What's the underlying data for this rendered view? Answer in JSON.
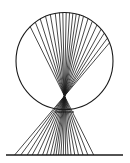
{
  "figure": {
    "stroke_color": "#1a1a1a",
    "background": "#ffffff",
    "circle": {
      "cx": 64.5,
      "cy": 61,
      "r": 48.5
    },
    "focal_point": {
      "x": 64.5,
      "y": 96
    },
    "baseline": {
      "y": 155,
      "x1": 6,
      "x2": 123
    },
    "inner_chord": {
      "y": 112,
      "x1": 55,
      "x2": 74
    },
    "ray_angles_deg": [
      -135,
      -127,
      -120,
      -113,
      -107,
      -101,
      -96,
      -92,
      -88,
      -84,
      -80,
      -76,
      -72,
      -67,
      -61,
      -55,
      -48,
      -41,
      -35,
      -28,
      -22
    ]
  }
}
